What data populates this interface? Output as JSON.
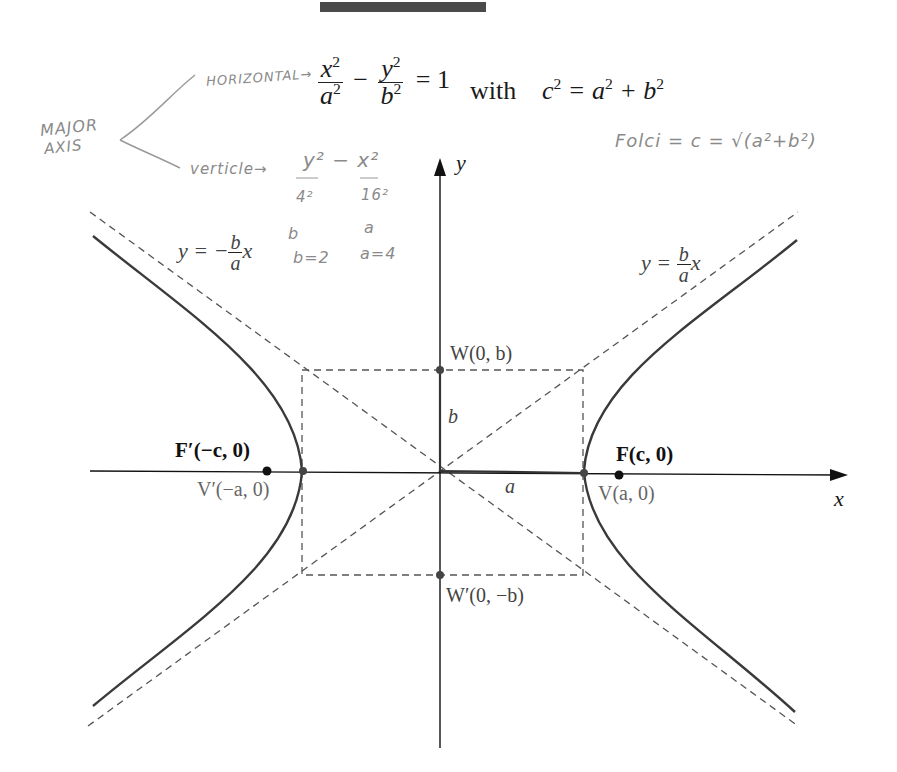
{
  "header_bar": {
    "color": "#4a4a4a"
  },
  "equation": {
    "x_term_num": "x",
    "x_term_den": "a",
    "minus": "−",
    "y_term_num": "y",
    "y_term_den": "b",
    "exp": "2",
    "equals_one": "= 1",
    "with_label": "with",
    "c_relation_lhs": "c",
    "c_relation_mid": " = a",
    "c_relation_plus": " + b"
  },
  "handwritten": {
    "major": "MAJOR",
    "axis": "AXIS",
    "horizontal": "HORIZONTAL→",
    "vertical": "verticle→",
    "vert_eq_y": "y² − x²",
    "vert_den_4": "4²",
    "vert_den_16": "16²",
    "b_label": "b",
    "a_label": "a",
    "b_value": "b=2",
    "a_value": "a=4",
    "foci": "Folci = c = √(a²+b²)"
  },
  "diagram": {
    "axis_x_label": "x",
    "axis_y_label": "y",
    "asymptote_neg": {
      "lhs": "y = −",
      "num": "b",
      "den": "a",
      "var": "x"
    },
    "asymptote_pos": {
      "lhs": "y = ",
      "num": "b",
      "den": "a",
      "var": "x"
    },
    "point_W": "W(0, b)",
    "point_W_prime": "W′(0, −b)",
    "point_F": "F(c, 0)",
    "point_F_prime": "F′(−c, 0)",
    "point_V": "V(a, 0)",
    "point_V_prime": "V′(−a, 0)",
    "segment_b": "b",
    "segment_a": "a",
    "colors": {
      "curve": "#3a3a3a",
      "axis": "#111111",
      "dashed": "#555555",
      "label_gray": "#555555"
    }
  }
}
